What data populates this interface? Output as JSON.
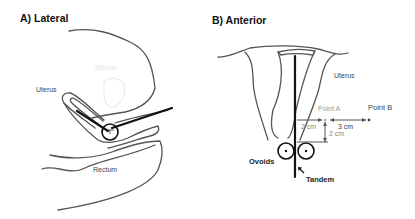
{
  "panels": {
    "lateral": {
      "title": "A) Lateral",
      "labels": {
        "uterus": "Uterus",
        "bladder": "Bladder",
        "rectum": "Rectum"
      }
    },
    "anterior": {
      "title": "B) Anterior",
      "labels": {
        "uterus": "Uterus",
        "point_a": "Point A",
        "point_b": "Point B",
        "dist_horizontal_a": "2 cm",
        "dist_vertical_a": "2 cm",
        "dist_a_to_b": "3 cm",
        "ovoids": "Ovoids",
        "tandem": "Tandem"
      }
    }
  },
  "colors": {
    "outline": "#555555",
    "applicator": "#111111",
    "point_a_label": "#9a9a9a",
    "faint_label": "#e6e6e6"
  }
}
